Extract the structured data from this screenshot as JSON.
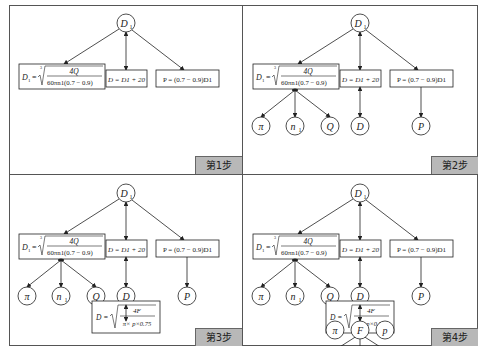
{
  "panels": [
    {
      "step": "第1步",
      "nodes": [
        "D1"
      ],
      "formulas": [
        "D1 = ∛(4Q / (60πn1(0.7−0.9)))",
        "D = D1 + 20",
        "P = (0.7−0.9)D1"
      ]
    },
    {
      "step": "第2步",
      "leaves": [
        "π",
        "n1",
        "Q",
        "D",
        "P"
      ]
    },
    {
      "step": "第3步",
      "extra_formula": "D = √(4F / (π×p×0.75))"
    },
    {
      "step": "第4步",
      "extra_leaves": [
        "π",
        "F",
        "p"
      ]
    }
  ],
  "labels": {
    "root": "D",
    "root_sub": "1",
    "f1_lhs": "D",
    "f2": "D = D",
    "f2_rest": " + 20",
    "f3": "P = (0.7 − 0.9)D",
    "num1": "4Q",
    "den1": "60πn",
    "den1_rest": "(0.7 − 0.9)",
    "num4": "4F",
    "den4": "π× p×0.75",
    "pi": "π",
    "n": "n",
    "Q": "Q",
    "D": "D",
    "P": "P",
    "F": "F",
    "p": "p",
    "eq": "=",
    "three": "3"
  }
}
